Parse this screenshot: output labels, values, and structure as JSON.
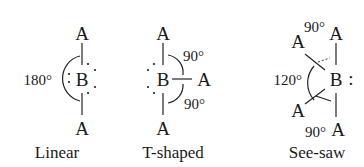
{
  "diagram": {
    "geometries": [
      {
        "name": "Linear",
        "central_atom": "B",
        "ligands": [
          "A",
          "A"
        ],
        "angles": [
          {
            "value": "180°"
          }
        ],
        "lone_pair_dots": "3 lone pairs around B"
      },
      {
        "name": "T-shaped",
        "central_atom": "B",
        "ligands": [
          "A",
          "A",
          "A"
        ],
        "angles": [
          {
            "value": "90°"
          },
          {
            "value": "90°"
          }
        ],
        "lone_pair_dots": "2 lone pairs on left of B"
      },
      {
        "name": "See-saw",
        "central_atom": "B",
        "ligands": [
          "A",
          "A",
          "A",
          "A"
        ],
        "angles": [
          {
            "value": "90°"
          },
          {
            "value": "120°"
          },
          {
            "value": "90°"
          }
        ],
        "lone_pair_dots": "1 lone pair on right of B"
      }
    ]
  },
  "text": {
    "atom_A": "A",
    "atom_B": "B",
    "linear_angle": "180°",
    "tshape_angle_top": "90°",
    "tshape_angle_bottom": "90°",
    "seesaw_angle_top": "90°",
    "seesaw_angle_mid": "120°",
    "seesaw_angle_bottom": "90°",
    "seesaw_colon": ":",
    "label_linear": "Linear",
    "label_tshaped": "T-shaped",
    "label_seesaw": "See-saw"
  }
}
